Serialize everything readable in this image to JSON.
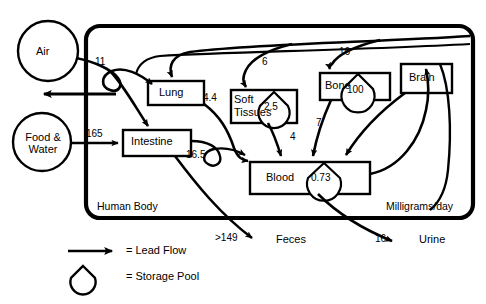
{
  "diagram": {
    "title_region_left": "Human Body",
    "title_region_right": "Milligrams/day",
    "sources": [
      {
        "id": "air",
        "label": "Air"
      },
      {
        "id": "food_water",
        "label_line1": "Food &",
        "label_line2": "Water"
      }
    ],
    "compartments": [
      {
        "id": "lung",
        "label": "Lung",
        "pool": null
      },
      {
        "id": "intestine",
        "label": "Intestine",
        "pool": null
      },
      {
        "id": "soft_tissues",
        "label_line1": "Soft",
        "label_line2": "Tissues",
        "pool": "2.5"
      },
      {
        "id": "bone",
        "label": "Bone",
        "pool": "100"
      },
      {
        "id": "brain",
        "label": "Brain",
        "pool": null
      },
      {
        "id": "blood",
        "label": "Blood",
        "pool": "0.73"
      }
    ],
    "sinks": [
      {
        "id": "feces",
        "label": "Feces"
      },
      {
        "id": "urine",
        "label": "Urine"
      }
    ],
    "flows": [
      {
        "id": "air-to-lung",
        "value": "11"
      },
      {
        "id": "food-to-intestine",
        "value": "165"
      },
      {
        "id": "lung-to-blood",
        "value": "4.4"
      },
      {
        "id": "intestine-to-blood",
        "value": "16.5"
      },
      {
        "id": "blood-to-soft-tissues",
        "value": "6"
      },
      {
        "id": "soft-tissues-to-blood",
        "value": "4"
      },
      {
        "id": "blood-to-bone",
        "value": "16"
      },
      {
        "id": "bone-to-blood",
        "value": "7"
      },
      {
        "id": "intestine-to-feces",
        "value": ">149"
      },
      {
        "id": "blood-to-urine",
        "value": "16"
      }
    ],
    "legend": [
      {
        "id": "lead-flow",
        "symbol": "arrow",
        "text": "= Lead Flow"
      },
      {
        "id": "storage-pool",
        "symbol": "pool",
        "text": "= Storage Pool"
      }
    ]
  }
}
